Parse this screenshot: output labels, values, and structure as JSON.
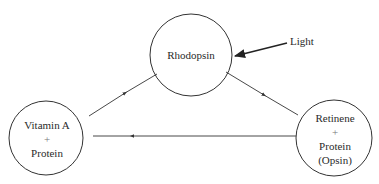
{
  "diagram": {
    "title": "",
    "nodes": {
      "rhodopsin": {
        "lines": [
          "Rhodopsin"
        ]
      },
      "vitamin_a": {
        "lines": [
          "Vitamin A",
          "+",
          "Protein"
        ]
      },
      "retinene": {
        "lines": [
          "Retinene",
          "+",
          "Protein",
          "(Opsin)"
        ]
      }
    },
    "external_input": {
      "label": "Light",
      "target": "Rhodopsin"
    },
    "edges": [
      {
        "from": "Vitamin A + Protein",
        "to": "Rhodopsin"
      },
      {
        "from": "Rhodopsin",
        "to": "Retinene + Protein (Opsin)"
      },
      {
        "from": "Retinene + Protein (Opsin)",
        "to": "Vitamin A + Protein"
      }
    ],
    "colors": {
      "stroke": "#333333",
      "text": "#2a2a2a",
      "background": "#ffffff"
    }
  }
}
